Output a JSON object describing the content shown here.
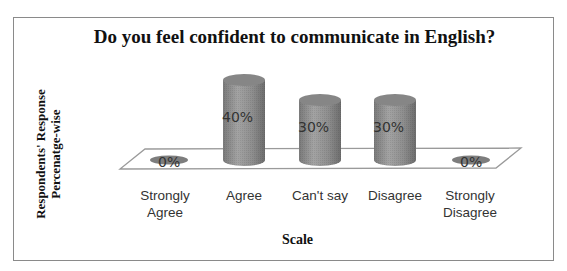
{
  "chart_data": {
    "type": "bar",
    "style": "3d-cylinder",
    "title": "Do you feel confident to communicate in English?",
    "xlabel": "Scale",
    "ylabel": "Respondents' Response Percenatge-wise",
    "ylabel_lines": [
      "Respondents' Response",
      "Percenatge-wise"
    ],
    "categories": [
      "Strongly Agree",
      "Agree",
      "Can't say",
      "Disagree",
      "Strongly Disagree"
    ],
    "category_lines": [
      [
        "Strongly",
        "Agree"
      ],
      [
        "Agree"
      ],
      [
        "Can't say"
      ],
      [
        "Disagree"
      ],
      [
        "Strongly",
        "Disagree"
      ]
    ],
    "values": [
      0,
      40,
      30,
      30,
      0
    ],
    "value_labels": [
      "0%",
      "40%",
      "30%",
      "30%",
      "0%"
    ],
    "unit": "%",
    "ylim": [
      0,
      50
    ],
    "grid": false,
    "legend": false,
    "data_labels": true,
    "bar_color": "#8c8c8c"
  }
}
